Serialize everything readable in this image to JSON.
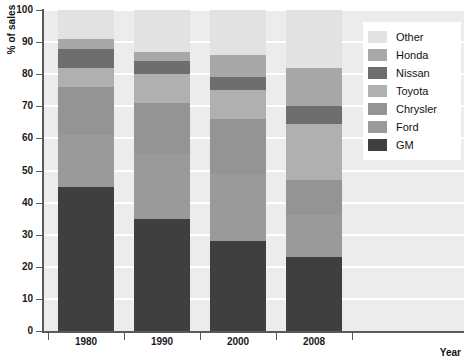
{
  "chart_data": {
    "type": "bar",
    "stacked": true,
    "title": "",
    "subtitle": "",
    "xlabel": "Year",
    "ylabel": "% of sales",
    "categories": [
      "1980",
      "1990",
      "2000",
      "2008"
    ],
    "ylim": [
      0,
      100
    ],
    "xlim_note": "categorical",
    "grid": true,
    "grid_axis": "y",
    "legend_position": "top-right",
    "ytick_labels": [
      "0",
      "10",
      "20",
      "30",
      "40",
      "50",
      "60",
      "70",
      "80",
      "90",
      "100"
    ],
    "ytick_values": [
      0,
      10,
      20,
      30,
      40,
      50,
      60,
      70,
      80,
      90,
      100
    ],
    "series": [
      {
        "name": "GM",
        "color": "#3f3f3f",
        "values": [
          45.0,
          35.0,
          28.0,
          23.0
        ]
      },
      {
        "name": "Ford",
        "color": "#9a9a9a",
        "values": [
          16.0,
          20.0,
          21.0,
          13.0
        ]
      },
      {
        "name": "Chrysler",
        "color": "#949494",
        "values": [
          15.0,
          16.0,
          17.0,
          11.0
        ]
      },
      {
        "name": "Toyota",
        "color": "#b0b0b0",
        "values": [
          6.0,
          9.0,
          9.0,
          17.5
        ]
      },
      {
        "name": "Nissan",
        "color": "#6e6e6e",
        "values": [
          6.0,
          4.0,
          4.0,
          5.5
        ]
      },
      {
        "name": "Honda",
        "color": "#a8a8a8",
        "values": [
          3.0,
          3.0,
          7.0,
          12.0
        ]
      },
      {
        "name": "Other",
        "color": "#e2e2e2",
        "values": [
          9.0,
          13.0,
          14.0,
          18.0
        ]
      }
    ],
    "cumulative_tops": {
      "1980": {
        "GM": 45.0,
        "Ford": 61.0,
        "Chrysler": 76.0,
        "Toyota": 82.0,
        "Nissan": 88.0,
        "Honda": 91.0,
        "Other": 100.0
      },
      "1990": {
        "GM": 35.0,
        "Ford": 55.0,
        "Chrysler": 71.0,
        "Toyota": 80.0,
        "Nissan": 84.0,
        "Honda": 87.0,
        "Other": 100.0
      },
      "2000": {
        "GM": 28.0,
        "Ford": 49.0,
        "Chrysler": 66.0,
        "Toyota": 75.0,
        "Nissan": 79.0,
        "Honda": 86.0,
        "Other": 100.0
      },
      "2008": {
        "GM": 23.0,
        "Ford": 36.0,
        "Chrysler": 47.0,
        "Toyota": 64.5,
        "Nissan": 70.0,
        "Honda": 82.0,
        "Other": 100.0
      }
    }
  },
  "axes": {
    "y_title": "% of sales",
    "x_title": "Year"
  },
  "legend": {
    "entries": [
      {
        "label": "Other",
        "color": "#e2e2e2"
      },
      {
        "label": "Honda",
        "color": "#a8a8a8"
      },
      {
        "label": "Nissan",
        "color": "#6e6e6e"
      },
      {
        "label": "Toyota",
        "color": "#b0b0b0"
      },
      {
        "label": "Chrysler",
        "color": "#949494"
      },
      {
        "label": "Ford",
        "color": "#9a9a9a"
      },
      {
        "label": "GM",
        "color": "#3f3f3f"
      }
    ]
  },
  "style": {
    "plot_background": "#ececec",
    "gridline_color": "#ffffff",
    "axis_color": "#5a5a5a",
    "page_background": "#ffffff"
  }
}
